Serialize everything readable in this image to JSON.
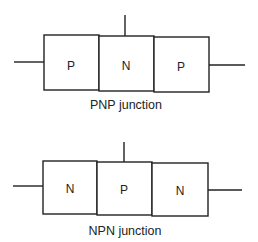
{
  "diagrams": [
    {
      "caption": "PNP junction",
      "regions": [
        {
          "label": "P"
        },
        {
          "label": "N"
        },
        {
          "label": "P"
        }
      ]
    },
    {
      "caption": "NPN junction",
      "regions": [
        {
          "label": "N"
        },
        {
          "label": "P"
        },
        {
          "label": "N"
        }
      ]
    }
  ],
  "colors": {
    "stroke": "#222222",
    "background": "#ffffff"
  }
}
